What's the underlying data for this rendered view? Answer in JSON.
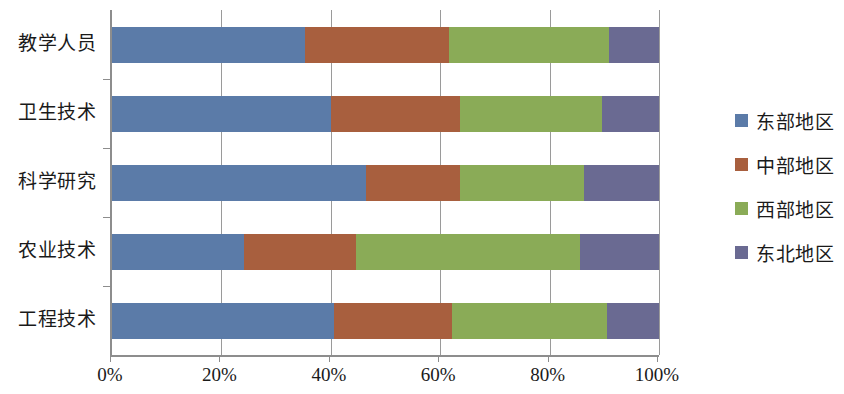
{
  "chart_data": {
    "type": "bar",
    "orientation": "horizontal",
    "stacked": true,
    "normalized_percent": true,
    "title": "",
    "subtitle": "",
    "xlabel": "",
    "ylabel": "",
    "xlim": [
      0,
      100
    ],
    "grid": true,
    "legend_position": "right",
    "categories": [
      "教学人员",
      "卫生技术",
      "科学研究",
      "农业技术",
      "工程技术"
    ],
    "xticklabels": [
      "0%",
      "20%",
      "40%",
      "60%",
      "80%",
      "100%"
    ],
    "xtickvalues": [
      0,
      20,
      40,
      60,
      80,
      100
    ],
    "series": [
      {
        "name": "东部地区",
        "color": "#5b7ba8",
        "values": [
          35.2,
          40.0,
          46.4,
          24.1,
          40.5
        ]
      },
      {
        "name": "中部地区",
        "color": "#a85f3e",
        "values": [
          26.4,
          23.6,
          17.2,
          20.5,
          21.6
        ]
      },
      {
        "name": "西部地区",
        "color": "#8aab57",
        "values": [
          29.3,
          26.0,
          22.7,
          41.0,
          28.4
        ]
      },
      {
        "name": "东北地区",
        "color": "#6a6a92",
        "values": [
          9.1,
          10.4,
          13.7,
          14.4,
          9.5
        ]
      }
    ]
  },
  "legend": {
    "items": [
      {
        "label": "东部地区",
        "color": "#5b7ba8"
      },
      {
        "label": "中部地区",
        "color": "#a85f3e"
      },
      {
        "label": "西部地区",
        "color": "#8aab57"
      },
      {
        "label": "东北地区",
        "color": "#6a6a92"
      }
    ]
  }
}
